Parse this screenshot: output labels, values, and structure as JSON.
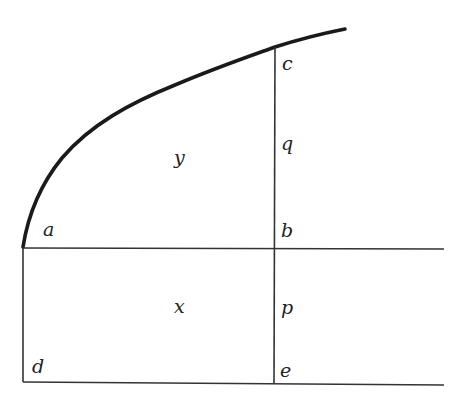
{
  "diagram": {
    "labels": {
      "a": "a",
      "b": "b",
      "c": "c",
      "d": "d",
      "e": "e",
      "p": "p",
      "q": "q",
      "x": "x",
      "y": "y"
    },
    "colors": {
      "stroke": "#1a1a1a",
      "background": "#ffffff"
    }
  }
}
